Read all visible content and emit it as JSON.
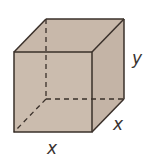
{
  "diagram": {
    "type": "rectangular-prism",
    "colors": {
      "fill": "#cbbcae",
      "top_fill": "#c8b8aa",
      "side_fill": "#c4b4a6",
      "edge": "#3a302a"
    },
    "labels": {
      "height": "y",
      "depth": "x",
      "width": "x"
    }
  }
}
